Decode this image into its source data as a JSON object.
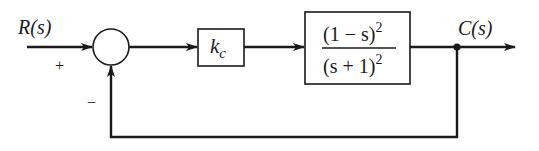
{
  "diagram": {
    "type": "block-diagram",
    "colors": {
      "line": "#1a1a1a",
      "background": "#ffffff"
    },
    "input": {
      "label": "R(s)",
      "sign": "+"
    },
    "summing_junction": {
      "feedback_sign": "−"
    },
    "controller": {
      "label_base": "k",
      "label_sub": "c"
    },
    "plant": {
      "numerator_base": "(1 − s)",
      "numerator_exp": "2",
      "denominator_base": "(s + 1)",
      "denominator_exp": "2"
    },
    "output": {
      "label": "C(s)"
    },
    "feedback": {
      "type": "unity",
      "sign": "negative"
    }
  }
}
